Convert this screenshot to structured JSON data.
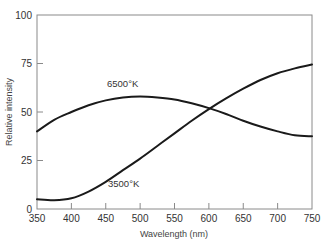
{
  "chart_data": {
    "type": "line",
    "title": "",
    "xlabel": "Wavelength (nm)",
    "ylabel": "Relative intensity",
    "xlim": [
      350,
      750
    ],
    "ylim": [
      0,
      100
    ],
    "xticks": [
      350,
      400,
      450,
      500,
      550,
      600,
      650,
      700,
      750
    ],
    "yticks": [
      0,
      25,
      50,
      75,
      100
    ],
    "grid": false,
    "legend": "none (inline curve annotations)",
    "x": [
      350,
      375,
      400,
      425,
      450,
      475,
      500,
      525,
      550,
      575,
      600,
      625,
      650,
      675,
      700,
      725,
      750
    ],
    "series": [
      {
        "name": "6500°K",
        "values": [
          40,
          46,
          50,
          53.5,
          56,
          57.5,
          58,
          57.5,
          56.5,
          54.5,
          52,
          49,
          45.5,
          42.5,
          40,
          38,
          37.5
        ]
      },
      {
        "name": "3500°K",
        "values": [
          5,
          4.5,
          5.5,
          9,
          14,
          20,
          26,
          32.5,
          39,
          45.5,
          51.5,
          57,
          62,
          66.5,
          70,
          72.5,
          74.5
        ]
      }
    ],
    "annotations": [
      {
        "text": "6500°K",
        "x": 500,
        "y": 63
      },
      {
        "text": "3500°K",
        "x": 505,
        "y": 11
      }
    ]
  },
  "labels": {
    "xlabel": "Wavelength (nm)",
    "ylabel": "Relative intensity",
    "annot_6500": "6500°K",
    "annot_3500": "3500°K"
  }
}
